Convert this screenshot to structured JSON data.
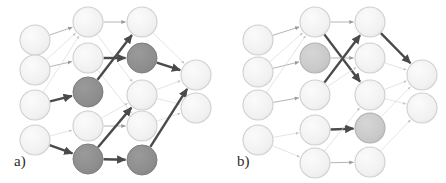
{
  "figure": {
    "width": 446,
    "height": 183,
    "background": "#ffffff",
    "caption_labels": {
      "panel_a": "a)",
      "panel_b": "b)"
    }
  },
  "style": {
    "node_radius": 15,
    "node_fill_inactive": "#f2f2f2",
    "node_fill_active": "#8e8e8e",
    "node_fill_semi_active": "#c9c9c9",
    "node_stroke_inactive": "#cfcfcf",
    "node_stroke_active": "#7d7d7d",
    "edge_color_faint": "#d8d8d8",
    "edge_color_light": "#b5b5b5",
    "edge_color_strong": "#4a4a4a",
    "edge_width_faint": 0.7,
    "edge_width_light": 1.0,
    "edge_width_strong": 2.4
  },
  "panels": [
    {
      "id": "panel-a",
      "label": "a)",
      "label_x": 14,
      "label_y": 166,
      "layers": [
        {
          "index": 0,
          "name": "input-layer",
          "x": 35,
          "nodes": [
            {
              "id": "a-l0-n0",
              "y": 40,
              "state": "inactive"
            },
            {
              "id": "a-l0-n1",
              "y": 70,
              "state": "inactive"
            },
            {
              "id": "a-l0-n2",
              "y": 105,
              "state": "inactive"
            },
            {
              "id": "a-l0-n3",
              "y": 140,
              "state": "inactive"
            }
          ]
        },
        {
          "index": 1,
          "name": "hidden-layer-1",
          "x": 88,
          "nodes": [
            {
              "id": "a-l1-n0",
              "y": 22,
              "state": "inactive"
            },
            {
              "id": "a-l1-n1",
              "y": 58,
              "state": "inactive"
            },
            {
              "id": "a-l1-n2",
              "y": 92,
              "state": "active"
            },
            {
              "id": "a-l1-n3",
              "y": 126,
              "state": "inactive"
            },
            {
              "id": "a-l1-n4",
              "y": 159,
              "state": "active"
            }
          ]
        },
        {
          "index": 2,
          "name": "hidden-layer-2",
          "x": 142,
          "nodes": [
            {
              "id": "a-l2-n0",
              "y": 22,
              "state": "inactive"
            },
            {
              "id": "a-l2-n1",
              "y": 58,
              "state": "active"
            },
            {
              "id": "a-l2-n2",
              "y": 95,
              "state": "inactive"
            },
            {
              "id": "a-l2-n3",
              "y": 126,
              "state": "inactive"
            },
            {
              "id": "a-l2-n4",
              "y": 160,
              "state": "active"
            }
          ]
        },
        {
          "index": 3,
          "name": "output-layer",
          "x": 196,
          "nodes": [
            {
              "id": "a-l3-n0",
              "y": 75,
              "state": "inactive"
            },
            {
              "id": "a-l3-n1",
              "y": 108,
              "state": "inactive"
            }
          ]
        }
      ],
      "edges": [
        {
          "from": [
            35,
            40
          ],
          "to": [
            88,
            22
          ],
          "weight": "light"
        },
        {
          "from": [
            35,
            70
          ],
          "to": [
            88,
            58
          ],
          "weight": "light"
        },
        {
          "from": [
            35,
            70
          ],
          "to": [
            88,
            22
          ],
          "weight": "faint"
        },
        {
          "from": [
            35,
            105
          ],
          "to": [
            88,
            92
          ],
          "weight": "strong"
        },
        {
          "from": [
            35,
            105
          ],
          "to": [
            88,
            22
          ],
          "weight": "faint"
        },
        {
          "from": [
            35,
            140
          ],
          "to": [
            88,
            159
          ],
          "weight": "strong"
        },
        {
          "from": [
            35,
            140
          ],
          "to": [
            88,
            126
          ],
          "weight": "faint"
        },
        {
          "from": [
            88,
            22
          ],
          "to": [
            142,
            22
          ],
          "weight": "light"
        },
        {
          "from": [
            88,
            22
          ],
          "to": [
            142,
            95
          ],
          "weight": "faint"
        },
        {
          "from": [
            88,
            58
          ],
          "to": [
            142,
            58
          ],
          "weight": "strong"
        },
        {
          "from": [
            88,
            58
          ],
          "to": [
            142,
            126
          ],
          "weight": "faint"
        },
        {
          "from": [
            88,
            92
          ],
          "to": [
            142,
            22
          ],
          "weight": "strong"
        },
        {
          "from": [
            88,
            126
          ],
          "to": [
            142,
            126
          ],
          "weight": "light"
        },
        {
          "from": [
            88,
            126
          ],
          "to": [
            142,
            95
          ],
          "weight": "faint"
        },
        {
          "from": [
            88,
            159
          ],
          "to": [
            142,
            160
          ],
          "weight": "strong"
        },
        {
          "from": [
            88,
            159
          ],
          "to": [
            142,
            95
          ],
          "weight": "strong"
        },
        {
          "from": [
            142,
            22
          ],
          "to": [
            196,
            75
          ],
          "weight": "faint"
        },
        {
          "from": [
            142,
            58
          ],
          "to": [
            196,
            75
          ],
          "weight": "strong"
        },
        {
          "from": [
            142,
            95
          ],
          "to": [
            196,
            75
          ],
          "weight": "faint"
        },
        {
          "from": [
            142,
            95
          ],
          "to": [
            196,
            108
          ],
          "weight": "faint"
        },
        {
          "from": [
            142,
            126
          ],
          "to": [
            196,
            108
          ],
          "weight": "faint"
        },
        {
          "from": [
            142,
            160
          ],
          "to": [
            196,
            75
          ],
          "weight": "strong"
        }
      ]
    },
    {
      "id": "panel-b",
      "label": "b)",
      "label_x": 237,
      "label_y": 166,
      "layers": [
        {
          "index": 0,
          "name": "input-layer",
          "x": 258,
          "nodes": [
            {
              "id": "b-l0-n0",
              "y": 40,
              "state": "inactive"
            },
            {
              "id": "b-l0-n1",
              "y": 72,
              "state": "inactive"
            },
            {
              "id": "b-l0-n2",
              "y": 105,
              "state": "inactive"
            },
            {
              "id": "b-l0-n3",
              "y": 140,
              "state": "inactive"
            }
          ]
        },
        {
          "index": 1,
          "name": "hidden-layer-1",
          "x": 315,
          "nodes": [
            {
              "id": "b-l1-n0",
              "y": 22,
              "state": "inactive"
            },
            {
              "id": "b-l1-n1",
              "y": 58,
              "state": "semi-active"
            },
            {
              "id": "b-l1-n2",
              "y": 95,
              "state": "inactive"
            },
            {
              "id": "b-l1-n3",
              "y": 130,
              "state": "inactive"
            },
            {
              "id": "b-l1-n4",
              "y": 163,
              "state": "inactive"
            }
          ]
        },
        {
          "index": 2,
          "name": "hidden-layer-2",
          "x": 370,
          "nodes": [
            {
              "id": "b-l2-n0",
              "y": 22,
              "state": "inactive"
            },
            {
              "id": "b-l2-n1",
              "y": 58,
              "state": "inactive"
            },
            {
              "id": "b-l2-n2",
              "y": 95,
              "state": "inactive"
            },
            {
              "id": "b-l2-n3",
              "y": 128,
              "state": "semi-active"
            },
            {
              "id": "b-l2-n4",
              "y": 162,
              "state": "inactive"
            }
          ]
        },
        {
          "index": 3,
          "name": "output-layer",
          "x": 422,
          "nodes": [
            {
              "id": "b-l3-n0",
              "y": 75,
              "state": "inactive"
            },
            {
              "id": "b-l3-n1",
              "y": 108,
              "state": "inactive"
            }
          ]
        }
      ],
      "edges": [
        {
          "from": [
            258,
            40
          ],
          "to": [
            315,
            22
          ],
          "weight": "light"
        },
        {
          "from": [
            258,
            72
          ],
          "to": [
            315,
            58
          ],
          "weight": "light"
        },
        {
          "from": [
            258,
            72
          ],
          "to": [
            315,
            22
          ],
          "weight": "faint"
        },
        {
          "from": [
            258,
            105
          ],
          "to": [
            315,
            95
          ],
          "weight": "light"
        },
        {
          "from": [
            258,
            105
          ],
          "to": [
            315,
            22
          ],
          "weight": "faint"
        },
        {
          "from": [
            258,
            140
          ],
          "to": [
            315,
            163
          ],
          "weight": "faint"
        },
        {
          "from": [
            258,
            140
          ],
          "to": [
            315,
            130
          ],
          "weight": "faint"
        },
        {
          "from": [
            315,
            22
          ],
          "to": [
            370,
            22
          ],
          "weight": "light"
        },
        {
          "from": [
            315,
            22
          ],
          "to": [
            370,
            95
          ],
          "weight": "strong"
        },
        {
          "from": [
            315,
            58
          ],
          "to": [
            370,
            58
          ],
          "weight": "light"
        },
        {
          "from": [
            315,
            95
          ],
          "to": [
            370,
            22
          ],
          "weight": "strong"
        },
        {
          "from": [
            315,
            95
          ],
          "to": [
            370,
            58
          ],
          "weight": "faint"
        },
        {
          "from": [
            315,
            130
          ],
          "to": [
            370,
            128
          ],
          "weight": "strong"
        },
        {
          "from": [
            315,
            163
          ],
          "to": [
            370,
            162
          ],
          "weight": "light"
        },
        {
          "from": [
            315,
            163
          ],
          "to": [
            370,
            95
          ],
          "weight": "faint"
        },
        {
          "from": [
            370,
            22
          ],
          "to": [
            422,
            75
          ],
          "weight": "strong"
        },
        {
          "from": [
            370,
            58
          ],
          "to": [
            422,
            75
          ],
          "weight": "faint"
        },
        {
          "from": [
            370,
            95
          ],
          "to": [
            422,
            75
          ],
          "weight": "faint"
        },
        {
          "from": [
            370,
            95
          ],
          "to": [
            422,
            108
          ],
          "weight": "faint"
        },
        {
          "from": [
            370,
            128
          ],
          "to": [
            422,
            75
          ],
          "weight": "faint"
        },
        {
          "from": [
            370,
            162
          ],
          "to": [
            422,
            108
          ],
          "weight": "faint"
        }
      ]
    }
  ],
  "chart_data": {
    "type": "diagram",
    "title": "",
    "panel_count": 2,
    "layer_sizes": [
      4,
      5,
      5,
      2
    ],
    "node_states": [
      "inactive",
      "semi-active",
      "active"
    ],
    "edge_weights": [
      "faint",
      "light",
      "strong"
    ]
  }
}
